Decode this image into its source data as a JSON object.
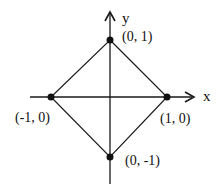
{
  "diagram": {
    "type": "coordinate-plane-square",
    "axes": {
      "x_label": "x",
      "y_label": "y"
    },
    "points": [
      {
        "name": "top",
        "label": "(0, 1)",
        "coord": [
          0,
          1
        ]
      },
      {
        "name": "right",
        "label": "(1, 0)",
        "coord": [
          1,
          0
        ]
      },
      {
        "name": "bottom",
        "label": "(0, -1)",
        "coord": [
          0,
          -1
        ]
      },
      {
        "name": "left",
        "label": "(-1, 0)",
        "coord": [
          -1,
          0
        ]
      }
    ],
    "shape": "square rotated 45° (|x| + |y| = 1)",
    "colors": {
      "line": "#1a1a1a",
      "point": "#111111",
      "background": "#ffffff"
    }
  }
}
